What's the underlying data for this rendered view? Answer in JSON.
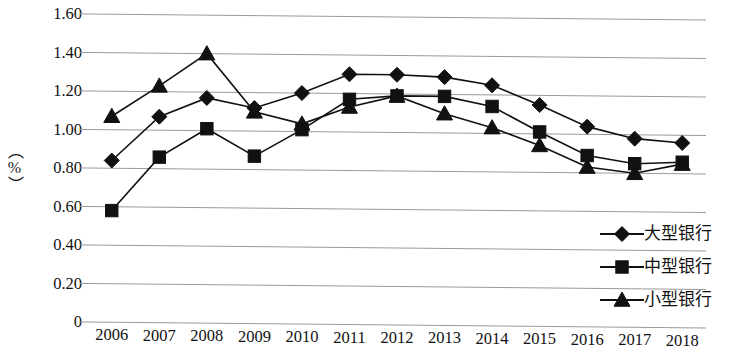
{
  "chart_data": {
    "type": "line",
    "title": "",
    "xlabel": "",
    "ylabel": "（%）",
    "categories": [
      "2006",
      "2007",
      "2008",
      "2009",
      "2010",
      "2011",
      "2012",
      "2013",
      "2014",
      "2015",
      "2016",
      "2017",
      "2018"
    ],
    "ylim": [
      0,
      1.6
    ],
    "y_ticks": [
      "0",
      "0.20",
      "0.40",
      "0.60",
      "0.80",
      "1.00",
      "1.20",
      "1.40",
      "1.60"
    ],
    "y_tick_values": [
      0,
      0.2,
      0.4,
      0.6,
      0.8,
      1.0,
      1.2,
      1.4,
      1.6
    ],
    "grid": true,
    "legend_position": "bottom-right",
    "series": [
      {
        "name": "大型银行",
        "marker": "diamond",
        "color": "#111111",
        "values": [
          0.84,
          1.07,
          1.17,
          1.12,
          1.2,
          1.3,
          1.3,
          1.29,
          1.25,
          1.15,
          1.04,
          0.98,
          0.96
        ]
      },
      {
        "name": "中型银行",
        "marker": "square",
        "color": "#111111",
        "values": [
          0.58,
          0.86,
          1.01,
          0.87,
          1.01,
          1.17,
          1.19,
          1.19,
          1.14,
          1.01,
          0.89,
          0.85,
          0.86
        ]
      },
      {
        "name": "小型银行",
        "marker": "triangle",
        "color": "#111111",
        "values": [
          1.07,
          1.23,
          1.4,
          1.1,
          1.04,
          1.13,
          1.19,
          1.1,
          1.03,
          0.94,
          0.83,
          0.8,
          0.85
        ]
      }
    ]
  },
  "axis": {
    "y_title": "（%）"
  },
  "legend": {
    "items": [
      {
        "label": "大型银行",
        "marker": "diamond-marker-icon"
      },
      {
        "label": "中型银行",
        "marker": "square-marker-icon"
      },
      {
        "label": "小型银行",
        "marker": "triangle-marker-icon"
      }
    ]
  },
  "style": {
    "grid_color": "#9a9a9a",
    "line_color": "#111111",
    "background": "#ffffff"
  }
}
